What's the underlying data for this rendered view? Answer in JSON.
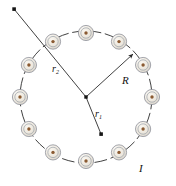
{
  "figure": {
    "background_color": "#ffffff",
    "width": 176,
    "height": 186
  },
  "colors": {
    "coil_fill": "#ece7dd",
    "coil_inner_fill": "#f3efe7",
    "coil_ring_stroke": "#8f929a",
    "coil_inner_stroke": "#9aa0a8",
    "coil_center_dot": "#8a5a32",
    "ring_path_stroke": "#2b2b2b",
    "radius_line_stroke": "#2b2b2b",
    "endpoint_dot": "#151515",
    "label_color": "#111111"
  },
  "geometry": {
    "ring_center": {
      "x": 86,
      "y": 97
    },
    "ring_radius_x": 66,
    "ring_radius_y": 64,
    "coil_outer_radius": 7.6,
    "coil_mid_radius": 5.2,
    "coil_inner_radius": 3.6,
    "coil_dot_radius": 1.7,
    "coil_count": 12
  },
  "coils": [
    {
      "name": "coil-1",
      "angle_deg": -90,
      "x": 86,
      "y": 33
    },
    {
      "name": "coil-2",
      "angle_deg": -60,
      "x": 119,
      "y": 41.6
    },
    {
      "name": "coil-3",
      "angle_deg": -30,
      "x": 143.1,
      "y": 65
    },
    {
      "name": "coil-4",
      "angle_deg": 0,
      "x": 152,
      "y": 97
    },
    {
      "name": "coil-5",
      "angle_deg": 30,
      "x": 143.1,
      "y": 129
    },
    {
      "name": "coil-6",
      "angle_deg": 60,
      "x": 119,
      "y": 152.4
    },
    {
      "name": "coil-7",
      "angle_deg": 90,
      "x": 86,
      "y": 161
    },
    {
      "name": "coil-8",
      "angle_deg": 120,
      "x": 53,
      "y": 152.4
    },
    {
      "name": "coil-9",
      "angle_deg": 150,
      "x": 28.9,
      "y": 129
    },
    {
      "name": "coil-10",
      "angle_deg": 180,
      "x": 20,
      "y": 97
    },
    {
      "name": "coil-11",
      "angle_deg": 210,
      "x": 28.9,
      "y": 65
    },
    {
      "name": "coil-12",
      "angle_deg": 240,
      "x": 53,
      "y": 41.6
    }
  ],
  "vectors": {
    "R": {
      "label": "R",
      "label_x": 122,
      "label_y": 84,
      "from": {
        "x": 86,
        "y": 97
      },
      "to": {
        "x": 133,
        "y": 54
      },
      "has_arrowhead": true,
      "description": "radius from ring center to the coil circle"
    },
    "r1": {
      "label": "r",
      "subscript": "1",
      "label_x": 95,
      "label_y": 117,
      "from": {
        "x": 86,
        "y": 97
      },
      "to": {
        "x": 101,
        "y": 134
      },
      "has_arrowhead": false,
      "endpoint_marker": "square-dot",
      "description": "distance from center to an interior field point"
    },
    "r2": {
      "label": "r",
      "subscript": "2",
      "label_x": 52,
      "label_y": 72,
      "from": {
        "x": 86,
        "y": 97
      },
      "to": {
        "x": 14,
        "y": 9
      },
      "has_arrowhead": false,
      "endpoint_marker": "square-dot",
      "description": "distance from center to an exterior field point"
    }
  },
  "current": {
    "label": "I",
    "label_x": 139,
    "label_y": 172,
    "description": "current circulating through the coils"
  },
  "center_marker": {
    "name": "ring-center-dot",
    "x": 86,
    "y": 97,
    "size": 3.2
  }
}
